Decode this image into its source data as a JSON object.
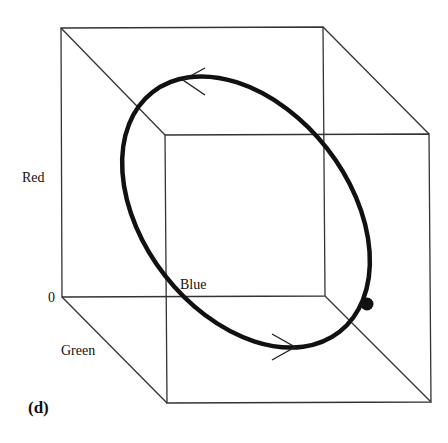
{
  "diagram": {
    "panel_label": "(d)",
    "axes": {
      "vertical": "Red",
      "horizontal": "Blue",
      "depth": "Green",
      "origin": "0"
    },
    "elements": [
      {
        "type": "cube",
        "description": "wireframe RGB color cube"
      },
      {
        "type": "ellipse",
        "description": "closed trajectory inside cube",
        "arrows": [
          "left-pointing arrow at top",
          "right-pointing arrow at bottom"
        ]
      },
      {
        "type": "dot",
        "description": "marked point on trajectory, lower right"
      }
    ],
    "colors": {
      "line": "#222222",
      "background": "#ffffff"
    }
  }
}
